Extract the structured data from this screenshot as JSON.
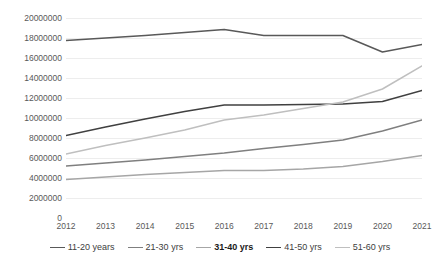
{
  "chart_data": {
    "type": "line",
    "title": "",
    "subtitle": "",
    "xlabel": "",
    "ylabel": "",
    "categories": [
      "2012",
      "2013",
      "2014",
      "2015",
      "2016",
      "2017",
      "2018",
      "2019",
      "2020",
      "2021"
    ],
    "ylim": [
      0,
      20000000
    ],
    "ytick_step": 2000000,
    "yticks": [
      "20000000",
      "18000000",
      "16000000",
      "14000000",
      "12000000",
      "10000000",
      "8000000",
      "6000000",
      "4000000",
      "2000000",
      "0"
    ],
    "grid": true,
    "grid_axis": "y",
    "legend_position": "bottom",
    "series": [
      {
        "name": "11-20 years",
        "color": "#595959",
        "emphasis": false,
        "values": [
          17750000,
          18000000,
          18250000,
          18550000,
          18850000,
          18250000,
          18250000,
          18250000,
          16600000,
          17350000
        ]
      },
      {
        "name": "21-30 yrs",
        "color": "#7f7f7f",
        "emphasis": false,
        "values": [
          5200000,
          5500000,
          5800000,
          6150000,
          6500000,
          6950000,
          7350000,
          7800000,
          8700000,
          9800000
        ]
      },
      {
        "name": "31-40 yrs",
        "color": "#a6a6a6",
        "emphasis": true,
        "values": [
          3850000,
          4100000,
          4350000,
          4550000,
          4750000,
          4750000,
          4900000,
          5150000,
          5650000,
          6250000
        ]
      },
      {
        "name": "41-50 yrs",
        "color": "#404040",
        "emphasis": false,
        "values": [
          8250000,
          9100000,
          9900000,
          10650000,
          11300000,
          11300000,
          11350000,
          11400000,
          11650000,
          12750000
        ]
      },
      {
        "name": "51-60 yrs",
        "color": "#bfbfbf",
        "emphasis": false,
        "values": [
          6400000,
          7250000,
          8000000,
          8800000,
          9800000,
          10300000,
          10950000,
          11600000,
          12900000,
          15200000
        ]
      }
    ]
  }
}
